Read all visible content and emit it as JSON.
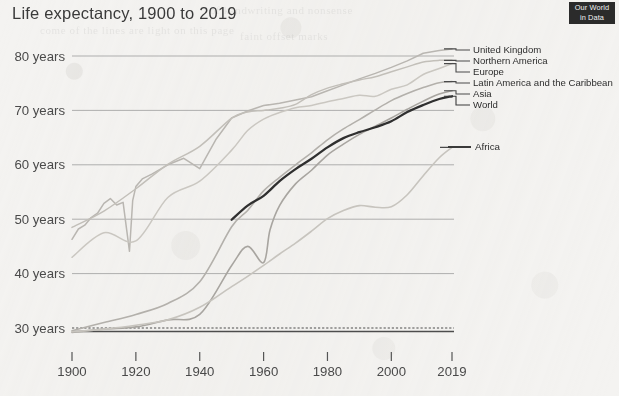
{
  "header": {
    "title": "Life expectancy, 1900 to 2019",
    "logo_line1": "Our World",
    "logo_line2": "in Data"
  },
  "chart_data": {
    "type": "line",
    "title": "Life expectancy, 1900 to 2019",
    "xlabel": "",
    "ylabel": "",
    "xlim": [
      1900,
      2019
    ],
    "ylim": [
      28,
      83
    ],
    "grid": true,
    "legend_position": "right-inline",
    "x_ticks": [
      1900,
      1920,
      1940,
      1960,
      1980,
      2000,
      2019
    ],
    "x_tick_labels": [
      "1900",
      "1920",
      "1940",
      "1960",
      "1980",
      "2000",
      "2019"
    ],
    "y_ticks": [
      30,
      40,
      50,
      60,
      70,
      80
    ],
    "y_tick_labels": [
      "30 years",
      "40 years",
      "50 years",
      "60 years",
      "70 years",
      "80 years"
    ],
    "series": [
      {
        "name": "United Kingdom",
        "color": "#b9b6b1",
        "width": 1.5,
        "x": [
          1900,
          1902,
          1904,
          1906,
          1908,
          1910,
          1912,
          1914,
          1916,
          1918,
          1919,
          1920,
          1922,
          1925,
          1930,
          1935,
          1940,
          1945,
          1950,
          1955,
          1960,
          1965,
          1970,
          1975,
          1980,
          1985,
          1990,
          1995,
          2000,
          2005,
          2010,
          2015,
          2019
        ],
        "y": [
          46.3,
          48.2,
          48.9,
          50.3,
          51.1,
          52.9,
          53.8,
          52.6,
          53.1,
          44.1,
          53.4,
          56.0,
          57.4,
          58.3,
          60.0,
          61.2,
          59.3,
          64.6,
          68.6,
          69.9,
          70.9,
          71.3,
          71.9,
          72.5,
          73.6,
          74.7,
          75.8,
          76.8,
          77.9,
          79.1,
          80.5,
          81.0,
          81.3
        ]
      },
      {
        "name": "Northern America",
        "color": "#c2bfb9",
        "width": 1.5,
        "x": [
          1900,
          1910,
          1920,
          1930,
          1940,
          1950,
          1955,
          1960,
          1965,
          1970,
          1975,
          1980,
          1985,
          1990,
          1995,
          2000,
          2005,
          2010,
          2015,
          2019
        ],
        "y": [
          48.5,
          51.5,
          55.6,
          60.1,
          63.4,
          68.6,
          69.7,
          70.0,
          70.4,
          71.1,
          72.9,
          74.1,
          74.9,
          75.6,
          76.2,
          77.1,
          78.0,
          78.9,
          79.2,
          79.2
        ]
      },
      {
        "name": "Europe",
        "color": "#cac7c1",
        "width": 1.5,
        "x": [
          1900,
          1910,
          1920,
          1930,
          1940,
          1950,
          1955,
          1960,
          1965,
          1970,
          1975,
          1980,
          1985,
          1990,
          1995,
          2000,
          2005,
          2010,
          2015,
          2019
        ],
        "y": [
          43.0,
          47.5,
          46.0,
          54.0,
          57.0,
          62.7,
          66.3,
          68.4,
          69.6,
          70.5,
          70.9,
          71.6,
          72.2,
          72.8,
          72.6,
          73.9,
          74.7,
          76.6,
          77.7,
          78.6
        ]
      },
      {
        "name": "Latin America and the Caribbean",
        "color": "#b3b0ab",
        "width": 1.6,
        "x": [
          1900,
          1910,
          1920,
          1930,
          1940,
          1950,
          1955,
          1960,
          1965,
          1970,
          1975,
          1980,
          1985,
          1990,
          1995,
          2000,
          2005,
          2010,
          2015,
          2019
        ],
        "y": [
          29.5,
          31.0,
          32.5,
          34.5,
          38.5,
          48.6,
          51.6,
          55.2,
          57.7,
          60.0,
          62.2,
          64.6,
          66.6,
          68.3,
          70.1,
          71.8,
          73.1,
          74.2,
          75.1,
          75.3
        ]
      },
      {
        "name": "Asia",
        "color": "#a8a5a0",
        "width": 1.6,
        "x": [
          1900,
          1910,
          1920,
          1930,
          1940,
          1950,
          1955,
          1960,
          1962,
          1965,
          1970,
          1975,
          1980,
          1985,
          1990,
          1995,
          2000,
          2005,
          2010,
          2015,
          2019
        ],
        "y": [
          29.2,
          29.8,
          30.2,
          31.5,
          32.5,
          41.5,
          45.0,
          42.0,
          48.0,
          52.5,
          56.5,
          59.0,
          61.8,
          63.8,
          65.6,
          67.1,
          68.6,
          70.2,
          71.7,
          73.0,
          73.6
        ]
      },
      {
        "name": "World",
        "color": "#2f2f2f",
        "width": 2.3,
        "x": [
          1950,
          1955,
          1960,
          1965,
          1970,
          1975,
          1980,
          1985,
          1990,
          1995,
          2000,
          2005,
          2010,
          2015,
          2019
        ],
        "y": [
          49.9,
          52.5,
          54.3,
          57.0,
          59.2,
          61.1,
          63.2,
          64.9,
          66.0,
          66.9,
          68.0,
          69.7,
          71.0,
          72.1,
          72.6
        ]
      },
      {
        "name": "Africa",
        "color": "#c7c4be",
        "width": 1.6,
        "x": [
          1900,
          1910,
          1920,
          1930,
          1940,
          1950,
          1955,
          1960,
          1965,
          1970,
          1975,
          1980,
          1985,
          1990,
          1995,
          2000,
          2005,
          2010,
          2015,
          2019
        ],
        "y": [
          29.3,
          29.8,
          30.5,
          31.5,
          33.8,
          37.6,
          39.5,
          41.5,
          43.6,
          45.6,
          47.8,
          50.1,
          51.6,
          52.5,
          52.2,
          52.3,
          54.5,
          58.0,
          61.3,
          63.2
        ]
      }
    ],
    "legend_entries": [
      {
        "label": "United Kingdom",
        "color": "#b9b6b1"
      },
      {
        "label": "Northern America",
        "color": "#c2bfb9"
      },
      {
        "label": "Europe",
        "color": "#cac7c1"
      },
      {
        "label": "Latin America and the Caribbean",
        "color": "#b3b0ab"
      },
      {
        "label": "Asia",
        "color": "#a8a5a0"
      },
      {
        "label": "World",
        "color": "#2f2f2f"
      },
      {
        "label": "Africa",
        "color": "#4a4a4a"
      }
    ]
  }
}
